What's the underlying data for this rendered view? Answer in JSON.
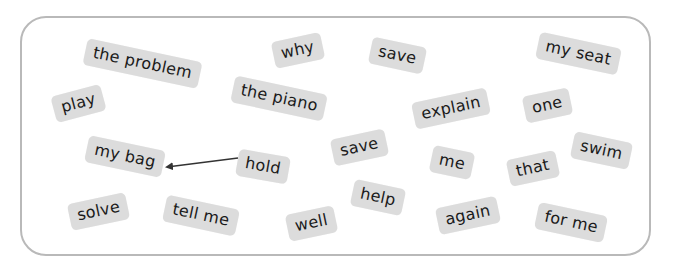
{
  "board": {
    "chips": [
      {
        "id": "the-problem",
        "label": "the problem",
        "cx": 142,
        "cy": 63,
        "rot": 12
      },
      {
        "id": "why",
        "label": "why",
        "cx": 298,
        "cy": 50,
        "rot": -12
      },
      {
        "id": "save-1",
        "label": "save",
        "cx": 397,
        "cy": 55,
        "rot": 12
      },
      {
        "id": "my-seat",
        "label": "my seat",
        "cx": 578,
        "cy": 53,
        "rot": 12
      },
      {
        "id": "play",
        "label": "play",
        "cx": 78,
        "cy": 103,
        "rot": -15
      },
      {
        "id": "the-piano",
        "label": "the piano",
        "cx": 279,
        "cy": 98,
        "rot": 12
      },
      {
        "id": "explain",
        "label": "explain",
        "cx": 451,
        "cy": 108,
        "rot": -12
      },
      {
        "id": "one",
        "label": "one",
        "cx": 547,
        "cy": 105,
        "rot": -12
      },
      {
        "id": "my-bag",
        "label": "my bag",
        "cx": 125,
        "cy": 156,
        "rot": 12
      },
      {
        "id": "hold",
        "label": "hold",
        "cx": 263,
        "cy": 166,
        "rot": 10
      },
      {
        "id": "save-2",
        "label": "save",
        "cx": 359,
        "cy": 147,
        "rot": -12
      },
      {
        "id": "me",
        "label": "me",
        "cx": 452,
        "cy": 162,
        "rot": 12
      },
      {
        "id": "that",
        "label": "that",
        "cx": 533,
        "cy": 168,
        "rot": -12
      },
      {
        "id": "swim",
        "label": "swim",
        "cx": 601,
        "cy": 150,
        "rot": 12
      },
      {
        "id": "solve",
        "label": "solve",
        "cx": 98,
        "cy": 211,
        "rot": -12
      },
      {
        "id": "tell-me",
        "label": "tell me",
        "cx": 201,
        "cy": 215,
        "rot": 12
      },
      {
        "id": "well",
        "label": "well",
        "cx": 311,
        "cy": 223,
        "rot": -12
      },
      {
        "id": "help",
        "label": "help",
        "cx": 378,
        "cy": 197,
        "rot": 12
      },
      {
        "id": "again",
        "label": "again",
        "cx": 468,
        "cy": 215,
        "rot": -12
      },
      {
        "id": "for-me",
        "label": "for me",
        "cx": 571,
        "cy": 222,
        "rot": 12
      }
    ],
    "arrow": {
      "from": "hold",
      "to": "my bag",
      "x1": 238,
      "y1": 158,
      "x2": 167,
      "y2": 167,
      "color": "#333333"
    },
    "colors": {
      "chip_bg": "#dcdcdc",
      "chip_text": "#1a1a1a",
      "frame_border": "#b9b9b9"
    }
  }
}
